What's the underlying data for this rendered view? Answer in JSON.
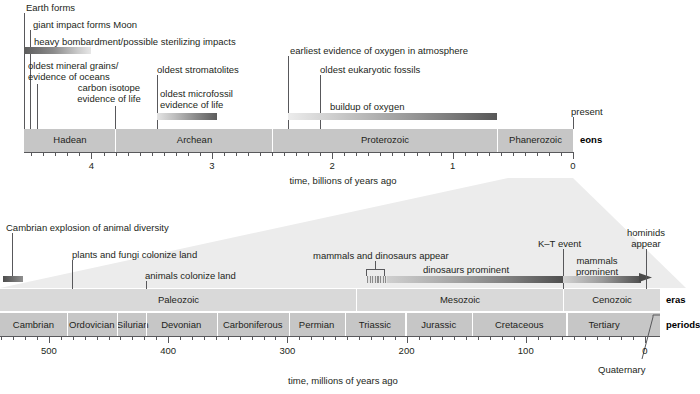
{
  "figure": {
    "colors": {
      "band": "#c6c6c6",
      "band_light": "#d9d9d9",
      "rule": "#58585b",
      "text": "#231f20",
      "wedge": "#e9e9e9"
    }
  },
  "top_timeline": {
    "axis": {
      "title": "time, billions of years ago",
      "tick_labels": [
        "4",
        "3",
        "2",
        "1",
        "0"
      ],
      "tick_values": [
        4,
        3,
        2,
        1,
        0
      ],
      "range_ga": [
        4.56,
        0
      ],
      "minor_tick_step_ga": 0.1
    },
    "row_label": "eons",
    "eons": [
      {
        "name": "Hadean",
        "start_ga": 4.56,
        "end_ga": 3.8
      },
      {
        "name": "Archean",
        "start_ga": 3.8,
        "end_ga": 2.5
      },
      {
        "name": "Proterozoic",
        "start_ga": 2.5,
        "end_ga": 0.541
      },
      {
        "name": "Phanerozoic",
        "start_ga": 0.541,
        "end_ga": 0
      }
    ],
    "events": [
      {
        "label": "Earth forms",
        "at_ga": 4.56
      },
      {
        "label": "giant impact forms Moon",
        "at_ga": 4.5
      },
      {
        "label": "heavy bombardment/possible sterilizing impacts",
        "at_ga": 4.45
      },
      {
        "label": "oldest mineral grains/\nevidence of oceans",
        "at_ga": 4.4
      },
      {
        "label": "carbon isotope\nevidence of life",
        "at_ga": 3.85
      },
      {
        "label": "oldest stromatolites",
        "at_ga": 3.5
      },
      {
        "label": "oldest microfossil\nevidence of life",
        "at_ga": 3.45
      },
      {
        "label": "earliest evidence of oxygen in atmosphere",
        "at_ga": 2.4
      },
      {
        "label": "oldest eukaryotic fossils",
        "at_ga": 2.1
      },
      {
        "label": "buildup of oxygen",
        "at_ga": 2.1
      },
      {
        "label": "present",
        "at_ga": 0
      }
    ],
    "bars": [
      {
        "name": "heavy bombardment",
        "from_ga": 4.56,
        "to_ga": 4.0,
        "shading": "dark-to-light"
      },
      {
        "name": "oldest microfossil evidence of life",
        "from_ga": 3.5,
        "to_ga": 3.0,
        "shading": "light-to-dark"
      },
      {
        "name": "buildup of oxygen",
        "from_ga": 2.4,
        "to_ga": 0.6,
        "shading": "light-to-dark"
      }
    ]
  },
  "bottom_timeline": {
    "axis": {
      "title": "time, millions of years ago",
      "tick_labels": [
        "500",
        "400",
        "300",
        "200",
        "100",
        "0"
      ],
      "tick_values": [
        500,
        400,
        300,
        200,
        100,
        0
      ],
      "range_ma": [
        541,
        0
      ],
      "minor_tick_step_ma": 10
    },
    "row_label_eras": "eras",
    "row_label_periods": "periods",
    "eras": [
      {
        "name": "Paleozoic",
        "start_ma": 541,
        "end_ma": 252
      },
      {
        "name": "Mesozoic",
        "start_ma": 252,
        "end_ma": 66
      },
      {
        "name": "Cenozoic",
        "start_ma": 66,
        "end_ma": 0
      }
    ],
    "periods": [
      {
        "name": "Cambrian",
        "start_ma": 541,
        "end_ma": 485
      },
      {
        "name": "Ordovician",
        "start_ma": 485,
        "end_ma": 443
      },
      {
        "name": "Silurian",
        "start_ma": 443,
        "end_ma": 419
      },
      {
        "name": "Devonian",
        "start_ma": 419,
        "end_ma": 359
      },
      {
        "name": "Carboniferous",
        "start_ma": 359,
        "end_ma": 299
      },
      {
        "name": "Permian",
        "start_ma": 299,
        "end_ma": 252
      },
      {
        "name": "Triassic",
        "start_ma": 252,
        "end_ma": 201
      },
      {
        "name": "Jurassic",
        "start_ma": 201,
        "end_ma": 145
      },
      {
        "name": "Cretaceous",
        "start_ma": 145,
        "end_ma": 66
      },
      {
        "name": "Tertiary",
        "start_ma": 66,
        "end_ma": 2.6
      },
      {
        "name": "Quaternary",
        "start_ma": 2.6,
        "end_ma": 0,
        "callout": true
      }
    ],
    "events": [
      {
        "label": "Cambrian explosion of animal diversity",
        "at_ma": 541
      },
      {
        "label": "plants and fungi colonize land",
        "at_ma": 470
      },
      {
        "label": "animals colonize land",
        "at_ma": 420
      },
      {
        "label": "mammals and dinosaurs appear",
        "at_ma": 230
      },
      {
        "label": "dinosaurs prominent",
        "at_ma": 180
      },
      {
        "label": "K–T event",
        "at_ma": 66
      },
      {
        "label": "mammals\nprominent",
        "at_ma": 40
      },
      {
        "label": "hominids\nappear",
        "at_ma": 6
      }
    ],
    "bars": [
      {
        "name": "dinosaurs prominent",
        "from_ma": 235,
        "to_ma": 66,
        "shading": "light-to-dark"
      },
      {
        "name": "mammals prominent",
        "from_ma": 66,
        "to_ma": 0,
        "shading": "light-to-dark",
        "arrow": true
      }
    ]
  }
}
